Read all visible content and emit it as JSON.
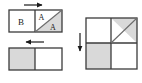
{
  "figure": {
    "background_color": "#ffffff",
    "stroke_color": "#3b3b3b",
    "shade_color": "#d9d9d9",
    "white_fill": "#ffffff",
    "arrow_color": "#1a1a1a"
  },
  "panels": [
    {
      "id": "top-left-rectangle",
      "name": "rectangle-with-regions-B-and-A",
      "x": 9,
      "y": 10,
      "width": 53,
      "height": 22,
      "divider_x": 35,
      "left_region": {
        "label": "B",
        "fill": "white",
        "label_x": 21,
        "label_y": 23
      },
      "right_region": {
        "diagonal": "bottom-left-to-top-right",
        "upper_triangle": {
          "label": "A",
          "fill": "white",
          "label_x": 41,
          "label_y": 19
        },
        "lower_triangle": {
          "label": "A",
          "fill": "shaded",
          "label_x": 52,
          "label_y": 28
        }
      },
      "arrow": {
        "id": "arrow-top-right",
        "direction": "right",
        "x1": 24,
        "y1": 5,
        "x2": 44,
        "y2": 5
      }
    },
    {
      "id": "bottom-left-rectangle",
      "name": "rectangle-half-shaded",
      "x": 9,
      "y": 48,
      "width": 53,
      "height": 22,
      "divider_x": 35,
      "left_region": {
        "label": "",
        "fill": "shaded"
      },
      "right_region": {
        "label": "",
        "fill": "white"
      },
      "arrow": {
        "id": "arrow-bottom-left",
        "direction": "left",
        "x1": 44,
        "y1": 42,
        "x2": 24,
        "y2": 42
      }
    },
    {
      "id": "right-square",
      "name": "square-quadrant-grid",
      "x": 86,
      "y": 18,
      "width": 51,
      "height": 51,
      "divider_x": 111,
      "divider_y": 43,
      "quadrants": {
        "top_left": {
          "fill": "white"
        },
        "top_right": {
          "diagonal": "bottom-left-to-top-right",
          "upper_triangle": {
            "fill": "shaded"
          },
          "lower_triangle": {
            "fill": "white"
          }
        },
        "bottom_left": {
          "fill": "shaded"
        },
        "bottom_right": {
          "fill": "white"
        }
      },
      "arrow": {
        "id": "arrow-left-down",
        "direction": "down",
        "x1": 80,
        "y1": 33,
        "x2": 80,
        "y2": 53
      }
    }
  ]
}
